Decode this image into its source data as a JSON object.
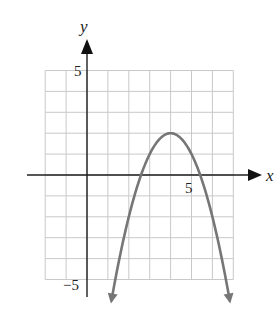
{
  "chart_data": {
    "type": "line",
    "title": "",
    "xlabel": "x",
    "ylabel": "y",
    "function": "y = -(x - 4)^2 + 2",
    "vertex": [
      4,
      2
    ],
    "x_intercepts": [
      2.59,
      5.41
    ],
    "y_intercept": -14,
    "opens": "down",
    "arrows_at_ends": true,
    "xlim": [
      -2,
      7
    ],
    "ylim": [
      -5,
      5
    ],
    "grid": true,
    "grid_step": 1,
    "x_tick_labels": [
      {
        "value": 5,
        "label": "5"
      }
    ],
    "y_tick_labels": [
      {
        "value": 5,
        "label": "5"
      },
      {
        "value": -5,
        "label": "−5"
      }
    ],
    "series": [
      {
        "name": "parabola",
        "x": [
          1.17,
          1.5,
          2,
          2.59,
          3,
          3.5,
          4,
          4.5,
          5,
          5.41,
          6,
          6.5,
          6.83
        ],
        "y": [
          -6,
          -4.25,
          -2,
          0,
          1,
          1.75,
          2,
          1.75,
          1,
          0,
          -2,
          -4.25,
          -6
        ]
      }
    ],
    "legend": null
  },
  "colors": {
    "curve": "#767676",
    "grid": "#c9c9c9",
    "axis": "#1e1e1e",
    "background": "#ffffff"
  },
  "labels": {
    "x_axis": "x",
    "y_axis": "y",
    "x_tick_5": "5",
    "y_tick_5": "5",
    "y_tick_neg5": "−5"
  }
}
